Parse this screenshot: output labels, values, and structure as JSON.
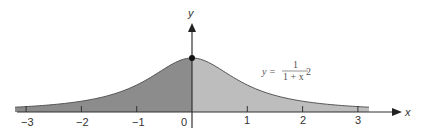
{
  "chart_data": {
    "type": "area",
    "title": "",
    "function": "y = 1/(1+x^2)",
    "xlabel": "x",
    "ylabel": "y",
    "xlim": [
      -3.2,
      3.2
    ],
    "ylim": [
      0,
      1
    ],
    "x_ticks": [
      -3,
      -2,
      -1,
      0,
      1,
      2,
      3
    ],
    "x_tick_labels": [
      "−3",
      "−2",
      "−1",
      "0",
      "1",
      "2",
      "3"
    ],
    "x": [
      -3,
      -2.5,
      -2,
      -1.5,
      -1,
      -0.5,
      0,
      0.5,
      1,
      1.5,
      2,
      2.5,
      3
    ],
    "series": [
      {
        "name": "y = 1/(1+x²)",
        "values": [
          0.1,
          0.138,
          0.2,
          0.308,
          0.5,
          0.8,
          1.0,
          0.8,
          0.5,
          0.308,
          0.2,
          0.138,
          0.1
        ]
      }
    ],
    "shading": {
      "left_region": {
        "x_range": [
          -3.2,
          0
        ],
        "color": "#8c8c8c"
      },
      "right_region": {
        "x_range": [
          0,
          3.2
        ],
        "color": "#bdbdbd"
      }
    },
    "annotations": [
      {
        "text": "y = 1/(1+x²)",
        "position": "right of peak"
      },
      {
        "text": "point at (0, 1)",
        "marker": "dot"
      }
    ],
    "grid": false,
    "legend": "none"
  },
  "labels": {
    "x_axis": "x",
    "y_axis": "y",
    "ticks": [
      "−3",
      "−2",
      "−1",
      "0",
      "1",
      "2",
      "3"
    ],
    "formula_lhs": "y =",
    "formula_num": "1",
    "formula_den_base": "1 + x",
    "formula_den_exp": "2"
  },
  "colors": {
    "left_fill": "#8c8c8c",
    "right_fill": "#bdbdbd",
    "axis": "#333333",
    "curve": "#555555"
  }
}
